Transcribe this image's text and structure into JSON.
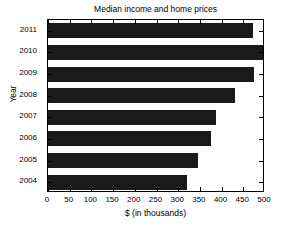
{
  "chart_data": {
    "type": "bar",
    "orientation": "horizontal",
    "title": "Median income and home prices",
    "xlabel": "$ (in thousands)",
    "ylabel": "Year",
    "categories": [
      "2011",
      "2010",
      "2009",
      "2008",
      "2007",
      "2006",
      "2005",
      "2004"
    ],
    "values": [
      472,
      500,
      475,
      430,
      388,
      375,
      345,
      320
    ],
    "xlim": [
      0,
      500
    ],
    "xticks": [
      0,
      50,
      100,
      150,
      200,
      250,
      300,
      350,
      400,
      450,
      500
    ],
    "xticklabels": [
      "0",
      "50",
      "100",
      "150",
      "200",
      "250",
      "300",
      "350",
      "400",
      "450",
      "500"
    ],
    "yticklabels": [
      "2011",
      "2010",
      "2009",
      "2008",
      "2007",
      "2006",
      "2005",
      "2004"
    ],
    "grid": false,
    "legend": null,
    "bar_color": "#1a1a1a",
    "frame_color": "#000000",
    "background": "#ffffff"
  }
}
